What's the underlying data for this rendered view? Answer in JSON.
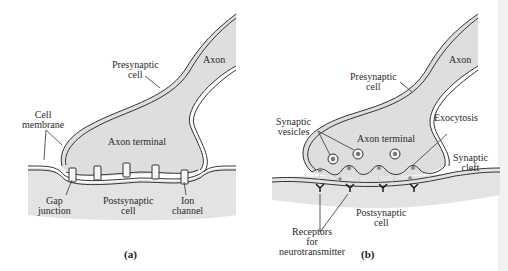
{
  "figure": {
    "colors": {
      "cytoplasm_fill": "#dedede",
      "membrane_stroke": "#333333",
      "background": "#ffffff"
    },
    "panels": [
      {
        "id": "a",
        "panel_label": "(a)",
        "labels": {
          "axon": "Axon",
          "presynaptic_line1": "Presynaptic",
          "presynaptic_line2": "cell",
          "cell_membrane_line1": "Cell",
          "cell_membrane_line2": "membrane",
          "axon_terminal": "Axon terminal",
          "gap_junction_line1": "Gap",
          "gap_junction_line2": "junction",
          "postsynaptic_line1": "Postsynaptic",
          "postsynaptic_line2": "cell",
          "ion_channel_line1": "Ion",
          "ion_channel_line2": "channel"
        }
      },
      {
        "id": "b",
        "panel_label": "(b)",
        "labels": {
          "axon": "Axon",
          "presynaptic_line1": "Presynaptic",
          "presynaptic_line2": "cell",
          "synaptic_vesicles_line1": "Synaptic",
          "synaptic_vesicles_line2": "vesicles",
          "axon_terminal": "Axon terminal",
          "exocytosis": "Exocytosis",
          "synaptic_cleft_line1": "Synaptic",
          "synaptic_cleft_line2": "cleft",
          "postsynaptic_line1": "Postsynaptic",
          "postsynaptic_line2": "cell",
          "receptors_line1": "Receptors",
          "receptors_line2": "for",
          "receptors_line3": "neurotransmitter"
        }
      }
    ]
  }
}
